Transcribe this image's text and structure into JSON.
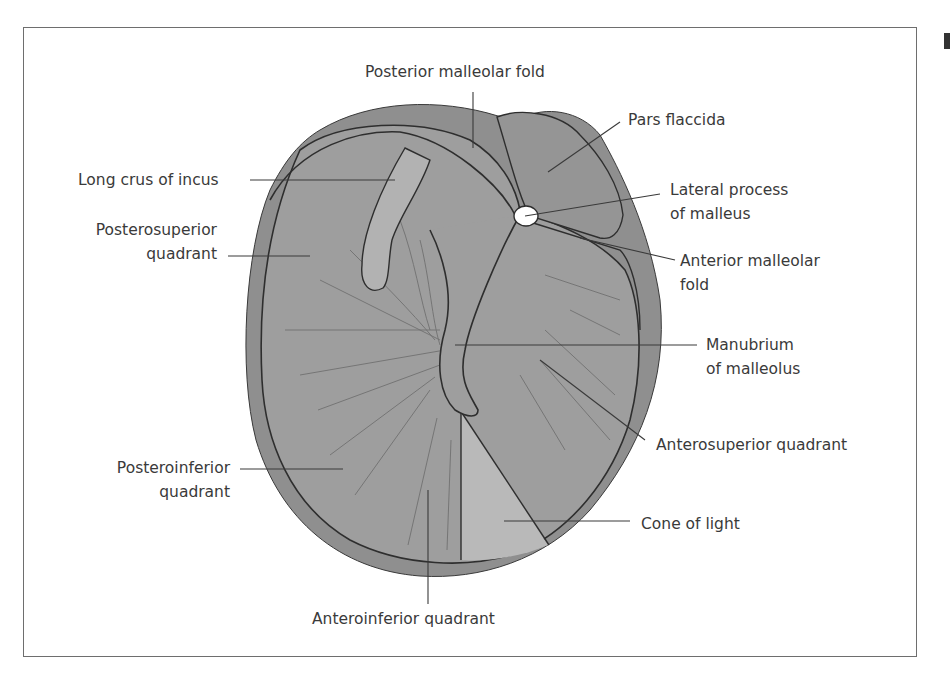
{
  "figure": {
    "colors": {
      "pars_tensa": "#9a9a9a",
      "annulus_rim": "#8e8e8e",
      "pars_flaccida": "#939393",
      "incus": "#b0b0b0",
      "cone_of_light": "#b8b8b8",
      "outline": "#2e2e2e",
      "leader": "#3a3a3a",
      "fibers": "#6f6f6f"
    }
  },
  "labels": {
    "posterior_malleolar_fold": "Posterior malleolar fold",
    "pars_flaccida": "Pars flaccida",
    "long_crus_of_incus": "Long crus of incus",
    "lateral_process": {
      "line1": "Lateral process",
      "line2": "of malleus"
    },
    "posterosuperior": {
      "line1": "Posterosuperior",
      "line2": "quadrant"
    },
    "anterior_malleolar_fold": {
      "line1": "Anterior malleolar",
      "line2": "fold"
    },
    "manubrium": {
      "line1": "Manubrium",
      "line2": "of malleolus"
    },
    "anterosuperior_quadrant": "Anterosuperior quadrant",
    "posteroinferior": {
      "line1": "Posteroinferior",
      "line2": "quadrant"
    },
    "cone_of_light": "Cone of light",
    "anteroinferior_quadrant": "Anteroinferior quadrant"
  }
}
